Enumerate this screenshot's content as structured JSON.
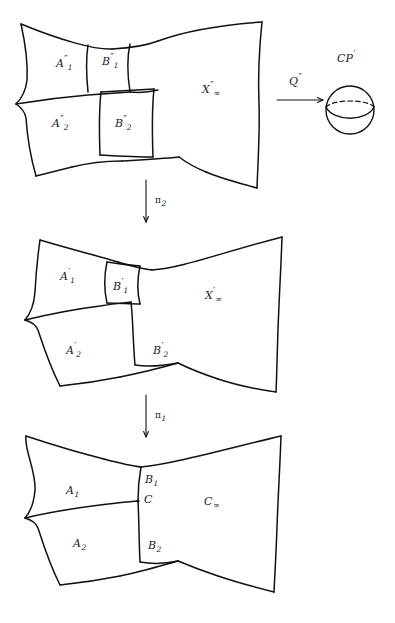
{
  "figure": {
    "background_color": "#ffffff",
    "ink_color": "#111111",
    "width": 395,
    "height": 623
  },
  "panels": {
    "top": {
      "name": "double-prime surface",
      "regions": [
        {
          "id": "A1pp",
          "base": "A",
          "sub": "1",
          "prime": "″"
        },
        {
          "id": "B1pp",
          "base": "B",
          "sub": "1",
          "prime": "″"
        },
        {
          "id": "A2pp",
          "base": "A",
          "sub": "2",
          "prime": "″"
        },
        {
          "id": "B2pp",
          "base": "B",
          "sub": "2",
          "prime": "″"
        },
        {
          "id": "Xpp",
          "base": "X",
          "sub": "∞",
          "prime": "″"
        }
      ]
    },
    "middle": {
      "name": "single-prime surface",
      "regions": [
        {
          "id": "A1p",
          "base": "A",
          "sub": "1",
          "prime": "′"
        },
        {
          "id": "B1p",
          "base": "B",
          "sub": "1",
          "prime": "′"
        },
        {
          "id": "A2p",
          "base": "A",
          "sub": "2",
          "prime": "′"
        },
        {
          "id": "B2p",
          "base": "B",
          "sub": "2",
          "prime": "′"
        },
        {
          "id": "Xp",
          "base": "X",
          "sub": "∞",
          "prime": "′"
        }
      ]
    },
    "bottom": {
      "name": "base surface",
      "regions": [
        {
          "id": "A1",
          "base": "A",
          "sub": "1",
          "prime": ""
        },
        {
          "id": "B1",
          "base": "B",
          "sub": "1",
          "prime": ""
        },
        {
          "id": "A2",
          "base": "A",
          "sub": "2",
          "prime": ""
        },
        {
          "id": "B2",
          "base": "B",
          "sub": "2",
          "prime": ""
        },
        {
          "id": "Cpt",
          "base": "C",
          "sub": "",
          "prime": ""
        },
        {
          "id": "Cinf",
          "base": "C",
          "sub": "∞",
          "prime": ""
        }
      ]
    }
  },
  "maps": {
    "horizontal": {
      "base": "Q",
      "prime": "″",
      "direction": "right"
    },
    "vertical_upper": {
      "base": "π",
      "sub": "2",
      "direction": "down"
    },
    "vertical_lower": {
      "base": "π",
      "sub": "1",
      "direction": "down"
    }
  },
  "target": {
    "name": "complex projective line",
    "base": "CP",
    "prime": "′",
    "shape": "sphere-with-equator"
  },
  "labels": {
    "A1pp": {
      "base": "A",
      "sub": "1",
      "prime": "″"
    },
    "B1pp": {
      "base": "B",
      "sub": "1",
      "prime": "″"
    },
    "A2pp": {
      "base": "A",
      "sub": "2",
      "prime": "″"
    },
    "B2pp": {
      "base": "B",
      "sub": "2",
      "prime": "″"
    },
    "Xpp": {
      "base": "X",
      "sub": "∞",
      "prime": "″"
    },
    "Qpp": {
      "base": "Q",
      "sub": "",
      "prime": "″"
    },
    "CPp": {
      "base": "CP",
      "sub": "",
      "prime": "′"
    },
    "pi2": {
      "base": "π",
      "sub": "2",
      "prime": ""
    },
    "A1p": {
      "base": "A",
      "sub": "1",
      "prime": "′"
    },
    "B1p": {
      "base": "B",
      "sub": "1",
      "prime": "′"
    },
    "A2p": {
      "base": "A",
      "sub": "2",
      "prime": "′"
    },
    "B2p": {
      "base": "B",
      "sub": "2",
      "prime": "′"
    },
    "Xp": {
      "base": "X",
      "sub": "∞",
      "prime": "′"
    },
    "pi1": {
      "base": "π",
      "sub": "1",
      "prime": ""
    },
    "A1": {
      "base": "A",
      "sub": "1",
      "prime": ""
    },
    "B1": {
      "base": "B",
      "sub": "1",
      "prime": ""
    },
    "A2": {
      "base": "A",
      "sub": "2",
      "prime": ""
    },
    "B2": {
      "base": "B",
      "sub": "2",
      "prime": ""
    },
    "C": {
      "base": "C",
      "sub": "",
      "prime": ""
    },
    "Cinf": {
      "base": "C",
      "sub": "∞",
      "prime": ""
    }
  }
}
